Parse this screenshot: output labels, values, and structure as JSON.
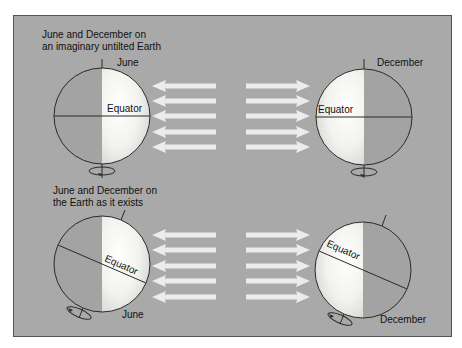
{
  "diagram": {
    "colors": {
      "background": "#a9a9a9",
      "lit_hemisphere": "#f4f4f0",
      "dark_hemisphere": "#a3a3a3",
      "arrow": "#ececec",
      "outline": "#2a2a2a"
    },
    "top_panel": {
      "caption_line1": "June and December on",
      "caption_line2": "an imaginary untilted Earth",
      "left_globe": {
        "month": "June",
        "equator_label": "Equator",
        "tilt_deg": 0
      },
      "right_globe": {
        "month": "December",
        "equator_label": "Equator",
        "tilt_deg": 0
      },
      "arrows_left_count": 5,
      "arrows_right_count": 5
    },
    "bottom_panel": {
      "caption_line1": "June and December on",
      "caption_line2": "the Earth as it exists",
      "left_globe": {
        "month": "June",
        "equator_label": "Equator",
        "tilt_deg": 23.5
      },
      "right_globe": {
        "month": "December",
        "equator_label": "Equator",
        "tilt_deg": 23.5
      },
      "arrows_left_count": 5,
      "arrows_right_count": 5
    }
  }
}
